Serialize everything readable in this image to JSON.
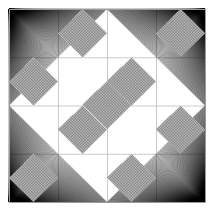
{
  "figure": {
    "type": "generative-line-art",
    "canvas": {
      "width": 215,
      "height": 212,
      "background_color": "#ffffff"
    },
    "frame": {
      "label": "outer-square-frame",
      "x": 9,
      "y": 9,
      "width": 196,
      "height": 193,
      "stroke_color": "#9a9a9a",
      "stroke_width": 1,
      "fill": "none"
    },
    "grid": {
      "label": "inner-construction-grid",
      "columns": 4,
      "rows": 4,
      "stroke_color": "#b4b4b4",
      "stroke_width": 0.7,
      "visible_interior_lines": true
    },
    "diamonds": {
      "label": "crosshatched-diamonds",
      "description": "Diamonds inscribed in alternating grid cells forming a checkerboard arrangement",
      "hatch_stroke_color": "#3c3c3c",
      "hatch_stroke_width": 0.45,
      "hatch_step": 1.55,
      "hatch_directions": 2,
      "outline_color": "#555555",
      "cells": [
        [
          0,
          1
        ],
        [
          0,
          3
        ],
        [
          1,
          0
        ],
        [
          1,
          2
        ],
        [
          2,
          1
        ],
        [
          2,
          3
        ],
        [
          3,
          0
        ],
        [
          3,
          2
        ]
      ],
      "count": 8
    },
    "center_diamond": {
      "label": "center-diamond",
      "center_x": 107,
      "center_y": 105,
      "half_width": 24.5,
      "half_height": 24.1,
      "hatch_stroke_color": "#3c3c3c"
    },
    "fans": {
      "label": "corner-line-fans",
      "description": "Dense straight-line fans converging at each corner of the outer frame and spreading to the opposite inner diamond edge",
      "count": 4,
      "lines_per_fan": 150,
      "stroke_color": "#000000",
      "stroke_width": 0.4,
      "corners": [
        {
          "name": "top-left",
          "x": 9,
          "y": 9
        },
        {
          "name": "top-right",
          "x": 205,
          "y": 9
        },
        {
          "name": "bottom-right",
          "x": 205,
          "y": 202
        },
        {
          "name": "bottom-left",
          "x": 9,
          "y": 202
        }
      ]
    },
    "symmetry": {
      "label": "four-fold-rotational",
      "order": 4,
      "mirror_axes": 4
    },
    "palette": {
      "background": "#ffffff",
      "frame_line": "#9a9a9a",
      "grid_line": "#b4b4b4",
      "hatch_line": "#3c3c3c",
      "fan_line": "#000000"
    }
  }
}
